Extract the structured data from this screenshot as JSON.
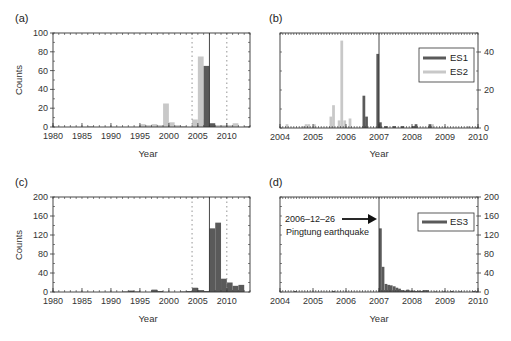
{
  "chart_data": [
    {
      "panel": "(a)",
      "type": "bar",
      "xlabel": "Year",
      "ylabel": "Counts",
      "xlim": [
        1980,
        2014
      ],
      "ylim": [
        0,
        100
      ],
      "xticks": [
        1980,
        1985,
        1990,
        1995,
        2000,
        2005,
        2010
      ],
      "yticks": [
        0,
        20,
        40,
        60,
        80,
        100
      ],
      "bin_width_years": 1,
      "vertical_lines": {
        "solid": 2007.0,
        "dotted": [
          2004.0,
          2010.0
        ]
      },
      "series": [
        {
          "name": "ES2",
          "color": "#c8c8c8",
          "x": [
            1986,
            1995,
            1996,
            1997,
            1998,
            1999,
            2000,
            2001,
            2002,
            2004,
            2005,
            2006,
            2007,
            2008,
            2009,
            2010,
            2011,
            2013
          ],
          "values": [
            1,
            3,
            2,
            3,
            2,
            25,
            5,
            2,
            1,
            8,
            75,
            8,
            3,
            2,
            2,
            2,
            4,
            1
          ]
        },
        {
          "name": "ES1",
          "color": "#5a5a5a",
          "x": [
            2006,
            2007
          ],
          "values": [
            65,
            4
          ]
        }
      ]
    },
    {
      "panel": "(b)",
      "type": "bar",
      "xlabel": "Year",
      "ylabel": "",
      "xlim": [
        2004,
        2010
      ],
      "ylim": [
        0,
        50
      ],
      "yaxis_side": "right",
      "xticks": [
        2004,
        2005,
        2006,
        2007,
        2008,
        2009,
        2010
      ],
      "yticks": [
        0,
        20,
        40
      ],
      "bin_width_years": 0.0833,
      "vertical_lines": {
        "solid": 2007.0
      },
      "legend": [
        "ES1",
        "ES2"
      ],
      "series": [
        {
          "name": "ES2",
          "color": "#c8c8c8",
          "x": [
            2004.17,
            2004.67,
            2004.75,
            2004.83,
            2005.0,
            2005.5,
            2005.58,
            2005.75,
            2005.83,
            2005.92,
            2006.08,
            2008.58,
            2009.67
          ],
          "values": [
            2,
            1,
            2,
            2,
            2,
            6,
            12,
            4,
            46,
            4,
            5,
            2,
            1
          ]
        },
        {
          "name": "ES1",
          "color": "#5a5a5a",
          "x": [
            2006.5,
            2006.58,
            2006.92,
            2007.0,
            2007.17,
            2007.42,
            2007.67,
            2008.0,
            2008.08,
            2008.5
          ],
          "values": [
            17,
            6,
            39,
            3,
            1,
            1,
            1,
            1,
            2,
            2
          ]
        }
      ]
    },
    {
      "panel": "(c)",
      "type": "bar",
      "xlabel": "Year",
      "ylabel": "Counts",
      "xlim": [
        1980,
        2014
      ],
      "ylim": [
        0,
        200
      ],
      "xticks": [
        1980,
        1985,
        1990,
        1995,
        2000,
        2005,
        2010
      ],
      "yticks": [
        0,
        40,
        80,
        120,
        160,
        200
      ],
      "bin_width_years": 1,
      "vertical_lines": {
        "solid": 2007.0,
        "dotted": [
          2004.0,
          2010.0
        ]
      },
      "series": [
        {
          "name": "ES3",
          "color": "#5a5a5a",
          "x": [
            1992,
            1993,
            1994,
            1997,
            1998,
            2002,
            2003,
            2004,
            2005,
            2006,
            2007,
            2008,
            2009,
            2010,
            2011,
            2012
          ],
          "values": [
            1,
            3,
            1,
            5,
            2,
            1,
            2,
            9,
            4,
            2,
            134,
            146,
            28,
            20,
            13,
            15
          ]
        }
      ]
    },
    {
      "panel": "(d)",
      "type": "bar",
      "xlabel": "Year",
      "ylabel": "",
      "xlim": [
        2004,
        2010
      ],
      "ylim": [
        0,
        200
      ],
      "yaxis_side": "right",
      "xticks": [
        2004,
        2005,
        2006,
        2007,
        2008,
        2009,
        2010
      ],
      "yticks": [
        0,
        40,
        80,
        120,
        160,
        200
      ],
      "bin_width_years": 0.0833,
      "vertical_lines": {
        "solid": 2007.0
      },
      "legend": [
        "ES3"
      ],
      "annotation": {
        "line1": "2006‒12‒26",
        "line2": "Pingtung earthquake",
        "arrow_to_year": 2007.0
      },
      "series": [
        {
          "name": "ES3",
          "color": "#5a5a5a",
          "x": [
            2004.42,
            2005.58,
            2007.0,
            2007.08,
            2007.17,
            2007.25,
            2007.33,
            2007.42,
            2007.5,
            2007.58,
            2007.67,
            2007.75,
            2007.83,
            2007.92,
            2008.0,
            2008.08,
            2008.17,
            2008.25,
            2008.33,
            2008.42,
            2008.67,
            2008.92,
            2009.17,
            2009.42,
            2009.83,
            2009.92
          ],
          "values": [
            2,
            2,
            134,
            53,
            17,
            15,
            14,
            12,
            9,
            7,
            4,
            3,
            5,
            3,
            3,
            2,
            3,
            2,
            4,
            4,
            1,
            1,
            2,
            1,
            2,
            1
          ]
        }
      ]
    }
  ],
  "labels": {
    "panel_a": "(a)",
    "panel_b": "(b)",
    "panel_c": "(c)",
    "panel_d": "(d)",
    "xlabel": "Year",
    "ylabel": "Counts",
    "legend_es1": "ES1",
    "legend_es2": "ES2",
    "legend_es3": "ES3",
    "annot_line1": "2006‒12‒26",
    "annot_line2": "Pingtung earthquake"
  },
  "colors": {
    "dark_bar": "#5a5a5a",
    "light_bar": "#c8c8c8",
    "axis": "#333333",
    "dotted": "#888888"
  }
}
